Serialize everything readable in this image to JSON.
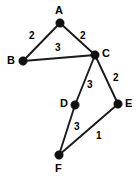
{
  "figure": {
    "type": "weighted-undirected-graph",
    "width": 139,
    "height": 180,
    "background_color": "#ffffff",
    "stroke_color": "#1a1a1a",
    "node_color": "#111111",
    "label_color": "#000000"
  },
  "nodes": [
    {
      "id": "A",
      "label": "A",
      "cx": 60,
      "cy": 23,
      "r": 4.2,
      "label_x": 55,
      "label_y": 5
    },
    {
      "id": "B",
      "label": "B",
      "cx": 23,
      "cy": 61,
      "r": 4.2,
      "label_x": 7,
      "label_y": 55
    },
    {
      "id": "C",
      "label": "C",
      "cx": 95,
      "cy": 55,
      "r": 4.2,
      "label_x": 102,
      "label_y": 48
    },
    {
      "id": "D",
      "label": "D",
      "cx": 75,
      "cy": 105,
      "r": 4.2,
      "label_x": 60,
      "label_y": 98
    },
    {
      "id": "E",
      "label": "E",
      "cx": 118,
      "cy": 104,
      "r": 4.2,
      "label_x": 125,
      "label_y": 98
    },
    {
      "id": "F",
      "label": "F",
      "cx": 59,
      "cy": 155,
      "r": 4.2,
      "label_x": 55,
      "label_y": 163
    }
  ],
  "edges": [
    {
      "id": "A-B",
      "source": "A",
      "target": "B",
      "weight": "2",
      "x1": 60,
      "y1": 23,
      "x2": 23,
      "y2": 61,
      "label_x": 29,
      "label_y": 31
    },
    {
      "id": "A-C",
      "source": "A",
      "target": "C",
      "weight": "2",
      "x1": 60,
      "y1": 23,
      "x2": 95,
      "y2": 55,
      "label_x": 80,
      "label_y": 31
    },
    {
      "id": "B-C",
      "source": "B",
      "target": "C",
      "weight": "3",
      "x1": 23,
      "y1": 61,
      "x2": 95,
      "y2": 55,
      "label_x": 55,
      "label_y": 43
    },
    {
      "id": "C-D",
      "source": "C",
      "target": "D",
      "weight": "3",
      "x1": 95,
      "y1": 55,
      "x2": 75,
      "y2": 105,
      "label_x": 87,
      "label_y": 80
    },
    {
      "id": "C-E",
      "source": "C",
      "target": "E",
      "weight": "2",
      "x1": 95,
      "y1": 55,
      "x2": 118,
      "y2": 104,
      "label_x": 113,
      "label_y": 73
    },
    {
      "id": "D-F",
      "source": "D",
      "target": "F",
      "weight": "3",
      "x1": 75,
      "y1": 105,
      "x2": 59,
      "y2": 155,
      "label_x": 74,
      "label_y": 122
    },
    {
      "id": "E-F",
      "source": "E",
      "target": "F",
      "weight": "1",
      "x1": 118,
      "y1": 104,
      "x2": 59,
      "y2": 155,
      "label_x": 96,
      "label_y": 131
    }
  ],
  "chart_data": {
    "type": "diagram",
    "title": "",
    "graph_type": "weighted undirected graph",
    "node_ids": [
      "A",
      "B",
      "C",
      "D",
      "E",
      "F"
    ],
    "edge_list": [
      {
        "from": "A",
        "to": "B",
        "weight": 2
      },
      {
        "from": "A",
        "to": "C",
        "weight": 2
      },
      {
        "from": "B",
        "to": "C",
        "weight": 3
      },
      {
        "from": "C",
        "to": "D",
        "weight": 3
      },
      {
        "from": "C",
        "to": "E",
        "weight": 2
      },
      {
        "from": "D",
        "to": "F",
        "weight": 3
      },
      {
        "from": "E",
        "to": "F",
        "weight": 1
      }
    ]
  }
}
